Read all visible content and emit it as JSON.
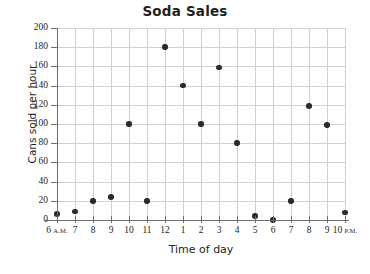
{
  "chart_data": {
    "type": "scatter",
    "title": "Soda Sales",
    "xlabel": "Time of day",
    "ylabel": "Cans sold per hour",
    "categories": [
      "6 A.M.",
      "7",
      "8",
      "9",
      "10",
      "11",
      "12",
      "1",
      "2",
      "3",
      "4",
      "5",
      "6",
      "7",
      "8",
      "9",
      "10 P.M."
    ],
    "x": [
      6,
      7,
      8,
      9,
      10,
      11,
      12,
      13,
      14,
      15,
      16,
      17,
      18,
      19,
      20,
      21,
      22
    ],
    "values": [
      6,
      9,
      20,
      24,
      100,
      20,
      180,
      140,
      100,
      159,
      80,
      4,
      0,
      20,
      119,
      99,
      8
    ],
    "xlim": [
      6,
      22
    ],
    "ylim": [
      0,
      200
    ],
    "ytick_labels": [
      "200",
      "180",
      "160",
      "140",
      "120",
      "100",
      "80",
      "60",
      "40",
      "20",
      "0"
    ],
    "ytick_values": [
      200,
      180,
      160,
      140,
      120,
      100,
      80,
      60,
      40,
      20,
      0
    ],
    "ystep": 20,
    "grid": true,
    "legend": "none",
    "marker_color": "#2b2b2e",
    "grid_color": "#cfcfd1",
    "axis_color": "#6d6e71",
    "text_color": "#231f20"
  },
  "xtick_suffixes": {
    "first": "A.M.",
    "last": "P.M."
  }
}
